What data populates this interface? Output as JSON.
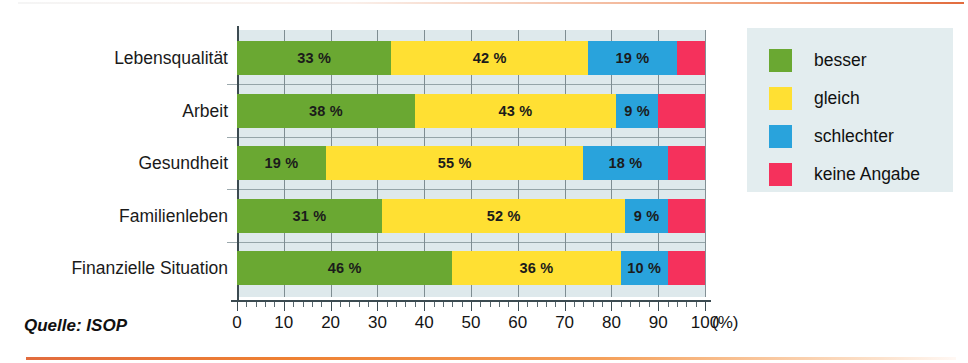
{
  "source": {
    "text": "Quelle: ISOP"
  },
  "axis": {
    "unit_label": "(%)"
  },
  "legend": {
    "items": [
      {
        "label": "besser",
        "color": "#6aa832"
      },
      {
        "label": "gleich",
        "color": "#ffe033"
      },
      {
        "label": "schlechter",
        "color": "#29a3dc"
      },
      {
        "label": "keine Angabe",
        "color": "#f5315c"
      }
    ]
  },
  "chart_data": {
    "type": "bar",
    "orientation": "horizontal",
    "stacked": true,
    "title": "",
    "xlabel": "(%)",
    "ylabel": "",
    "xlim": [
      0,
      100
    ],
    "xticks": [
      0,
      10,
      20,
      30,
      40,
      50,
      60,
      70,
      80,
      90,
      100
    ],
    "xtick_labels": [
      "0",
      "10",
      "20",
      "30",
      "40",
      "50",
      "60",
      "70",
      "80",
      "90",
      "100"
    ],
    "minor_tick_step": 2,
    "grid": "vertical",
    "legend_position": "right",
    "categories": [
      "Lebensqualität",
      "Arbeit",
      "Gesundheit",
      "Familienleben",
      "Finanzielle Situation"
    ],
    "series": [
      {
        "name": "besser",
        "color": "#6aa832",
        "values": [
          33,
          38,
          19,
          31,
          46
        ]
      },
      {
        "name": "gleich",
        "color": "#ffe033",
        "values": [
          42,
          43,
          55,
          52,
          36
        ]
      },
      {
        "name": "schlechter",
        "color": "#29a3dc",
        "values": [
          19,
          9,
          18,
          9,
          10
        ]
      },
      {
        "name": "keine Angabe",
        "color": "#f5315c",
        "values": [
          6,
          10,
          8,
          8,
          8
        ]
      }
    ],
    "data_labels": [
      {
        "category": "Lebensqualität",
        "labels": [
          "33 %",
          "42 %",
          "19 %",
          ""
        ]
      },
      {
        "category": "Arbeit",
        "labels": [
          "38 %",
          "43 %",
          "9 %",
          ""
        ]
      },
      {
        "category": "Gesundheit",
        "labels": [
          "19 %",
          "55 %",
          "18 %",
          ""
        ]
      },
      {
        "category": "Familienleben",
        "labels": [
          "31 %",
          "52 %",
          "9 %",
          ""
        ]
      },
      {
        "category": "Finanzielle Situation",
        "labels": [
          "46 %",
          "36 %",
          "10 %",
          ""
        ]
      }
    ]
  }
}
